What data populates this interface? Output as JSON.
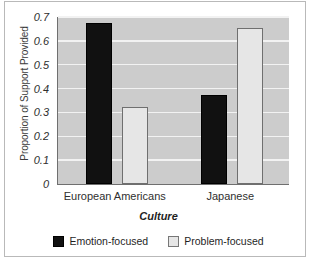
{
  "chart_data": {
    "type": "bar",
    "title": "",
    "xlabel": "Culture",
    "ylabel": "Proportion of Support Provided",
    "categories": [
      "European Americans",
      "Japanese"
    ],
    "series": [
      {
        "name": "Emotion-focused",
        "color": "#111111",
        "values": [
          0.665,
          0.365
        ]
      },
      {
        "name": "Problem-focused",
        "color": "#e6e6e6",
        "values": [
          0.315,
          0.645
        ]
      }
    ],
    "ylim": [
      0,
      0.7
    ],
    "ytick_labels": [
      "0.7",
      "0.6",
      "0.5",
      "0.4",
      "0.3",
      "0.2",
      "0.1",
      "0"
    ],
    "ytick_values": [
      0.7,
      0.6,
      0.5,
      0.4,
      0.3,
      0.2,
      0.1,
      0
    ],
    "grid": "horizontal",
    "legend_position": "bottom",
    "plot_background": "#cccccc",
    "gridline_color": "#f2f2f2"
  }
}
